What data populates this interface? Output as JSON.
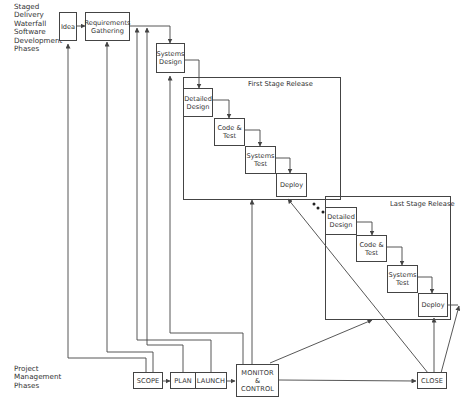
{
  "sections": {
    "top_label": "Staged Delivery Waterfall Software Development Phases",
    "top_label_lines": [
      "Staged",
      "Delivery",
      "Waterfall",
      "Software",
      "Development",
      "Phases"
    ],
    "bottom_label_lines": [
      "Project",
      "Management",
      "Phases"
    ]
  },
  "waterfall": {
    "idea": "Idea",
    "requirements": [
      "Requirements",
      "Gathering"
    ],
    "systems_design": [
      "Systems",
      "Design"
    ]
  },
  "first_stage": {
    "title": "First Stage Release",
    "detailed_design": [
      "Detailed",
      "Design"
    ],
    "code_test": [
      "Code &",
      "Test"
    ],
    "systems_test": [
      "Systems",
      "Test"
    ],
    "deploy": "Deploy"
  },
  "last_stage": {
    "title": "Last Stage Release",
    "detailed_design": [
      "Detailed",
      "Design"
    ],
    "code_test": [
      "Code &",
      "Test"
    ],
    "systems_test": [
      "Systems",
      "Test"
    ],
    "deploy": "Deploy"
  },
  "pm_phases": {
    "scope": "SCOPE",
    "plan": "PLAN",
    "launch": "LAUNCH",
    "monitor": [
      "MONITOR",
      "&",
      "CONTROL"
    ],
    "close": "CLOSE"
  },
  "colors": {
    "line": "#444444",
    "text": "#333333",
    "background": "#ffffff"
  }
}
